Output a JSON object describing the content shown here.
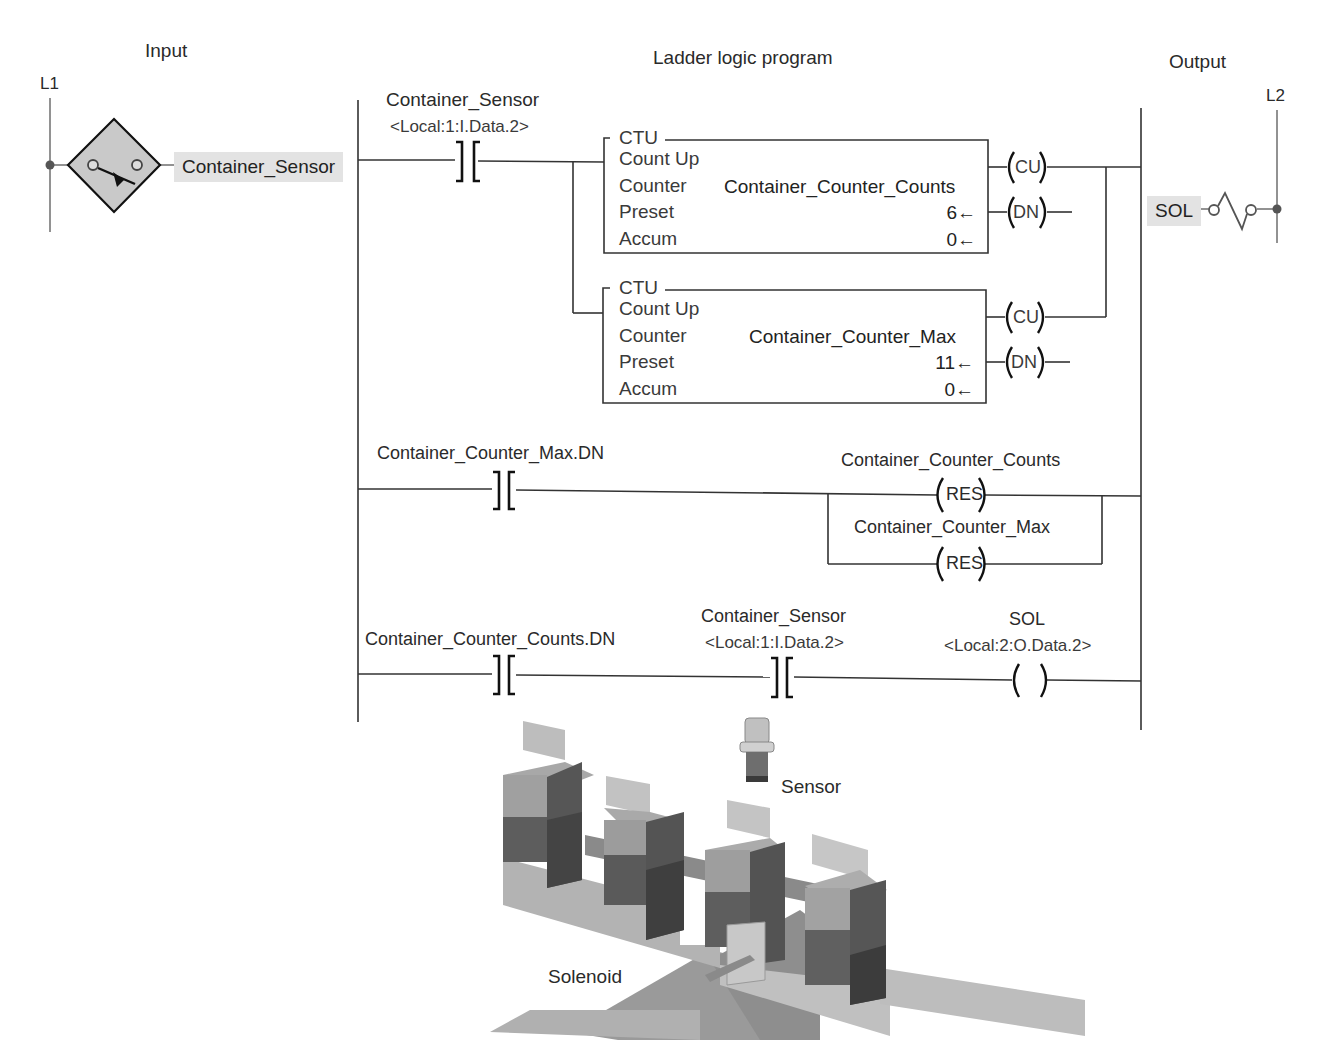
{
  "headers": {
    "input": "Input",
    "program": "Ladder logic program",
    "output": "Output"
  },
  "rails": {
    "left": "L1",
    "right": "L2"
  },
  "input_device": {
    "tag": "Container_Sensor",
    "icon": "proximity-sensor-switch-icon"
  },
  "output_device": {
    "tag": "SOL",
    "icon": "solenoid-coil-icon"
  },
  "rungs": [
    {
      "contact": {
        "tag": "Container_Sensor",
        "address": "<Local:1:I.Data.2>",
        "type": "XIC"
      },
      "counters": [
        {
          "type": "CTU",
          "title": "Count Up",
          "counter_label": "Counter",
          "counter_value": "Container_Counter_Counts",
          "preset_label": "Preset",
          "preset_value": "6←",
          "accum_label": "Accum",
          "accum_value": "0←",
          "outputs": [
            "CU",
            "DN"
          ]
        },
        {
          "type": "CTU",
          "title": "Count Up",
          "counter_label": "Counter",
          "counter_value": "Container_Counter_Max",
          "preset_label": "Preset",
          "preset_value": "11←",
          "accum_label": "Accum",
          "accum_value": "0←",
          "outputs": [
            "CU",
            "DN"
          ]
        }
      ]
    },
    {
      "contact": {
        "tag": "Container_Counter_Max.DN",
        "type": "XIC"
      },
      "resets": [
        {
          "tag": "Container_Counter_Counts",
          "label": "RES"
        },
        {
          "tag": "Container_Counter_Max",
          "label": "RES"
        }
      ]
    },
    {
      "contacts": [
        {
          "tag": "Container_Counter_Counts.DN",
          "type": "XIC"
        },
        {
          "tag": "Container_Sensor",
          "address": "<Local:1:I.Data.2>",
          "type": "XIC"
        }
      ],
      "coil": {
        "tag": "SOL",
        "address": "<Local:2:O.Data.2>",
        "type": "OTE"
      }
    }
  ],
  "illustration": {
    "sensor_label": "Sensor",
    "solenoid_label": "Solenoid",
    "carton_count": 4
  }
}
